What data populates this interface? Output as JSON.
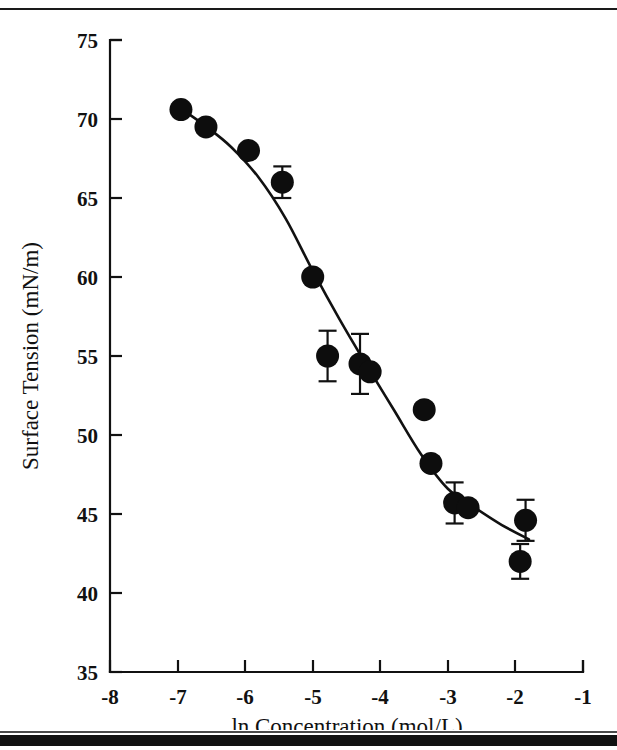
{
  "figure": {
    "background_color": "#ffffff",
    "ink_color": "#111111",
    "marker_color": "#0d0d0d",
    "top_rule": true,
    "bottom_rule": true
  },
  "chart_data": {
    "type": "scatter",
    "title": "",
    "xlabel": "ln Concentration (mol/L)",
    "ylabel": "Surface Tension (mN/m)",
    "xlim": [
      -8,
      -1
    ],
    "ylim": [
      35,
      75
    ],
    "xticks": [
      -8,
      -7,
      -6,
      -5,
      -4,
      -3,
      -2,
      -1
    ],
    "xticklabels": [
      "-8",
      "-7",
      "-6",
      "-5",
      "-4",
      "-3",
      "-2",
      "-1"
    ],
    "yticks": [
      35,
      40,
      45,
      50,
      55,
      60,
      65,
      70,
      75
    ],
    "yticklabels": [
      "35",
      "40",
      "45",
      "50",
      "55",
      "60",
      "65",
      "70",
      "75"
    ],
    "grid": false,
    "legend": false,
    "marker_style": "filled-circle",
    "series": [
      {
        "name": "Surface tension measurements",
        "points": [
          {
            "x": -6.95,
            "y": 70.6,
            "yerr": 0
          },
          {
            "x": -6.58,
            "y": 69.5,
            "yerr": 0
          },
          {
            "x": -5.95,
            "y": 68.0,
            "yerr": 0
          },
          {
            "x": -5.45,
            "y": 66.0,
            "yerr": 1.0
          },
          {
            "x": -5.0,
            "y": 60.0,
            "yerr": 0
          },
          {
            "x": -4.78,
            "y": 55.0,
            "yerr": 1.6
          },
          {
            "x": -4.3,
            "y": 54.5,
            "yerr": 1.9
          },
          {
            "x": -4.15,
            "y": 54.0,
            "yerr": 0
          },
          {
            "x": -3.35,
            "y": 51.6,
            "yerr": 0.3
          },
          {
            "x": -3.25,
            "y": 48.2,
            "yerr": 0.4
          },
          {
            "x": -2.9,
            "y": 45.7,
            "yerr": 1.3
          },
          {
            "x": -2.7,
            "y": 45.4,
            "yerr": 0
          },
          {
            "x": -1.93,
            "y": 42.0,
            "yerr": 1.1
          },
          {
            "x": -1.85,
            "y": 44.6,
            "yerr": 1.3
          }
        ]
      }
    ],
    "fit_curve": {
      "name": "sigmoidal fit",
      "description": "smooth decreasing sigmoid through the data",
      "x": [
        -7.0,
        -6.6,
        -6.2,
        -5.8,
        -5.4,
        -5.0,
        -4.6,
        -4.2,
        -3.8,
        -3.4,
        -3.0,
        -2.6,
        -2.2,
        -1.8
      ],
      "y": [
        70.8,
        69.6,
        68.2,
        66.3,
        63.7,
        60.4,
        57.3,
        54.4,
        51.6,
        48.8,
        46.6,
        45.4,
        44.3,
        43.4
      ]
    }
  }
}
